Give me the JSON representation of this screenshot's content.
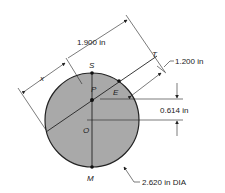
{
  "diagram": {
    "colors": {
      "circle_fill": "#a9a9a9",
      "stroke": "#222222",
      "background": "#ffffff"
    },
    "points": {
      "S": "S",
      "P": "P",
      "E": "E",
      "O": "O",
      "M": "M",
      "T": "T",
      "x": "x"
    },
    "dimensions": {
      "chord_length": "1.900 in",
      "tangent_offset": "1.200 in",
      "vertical_offset": "0.614 in",
      "diameter": "2.620 in DIA"
    }
  }
}
